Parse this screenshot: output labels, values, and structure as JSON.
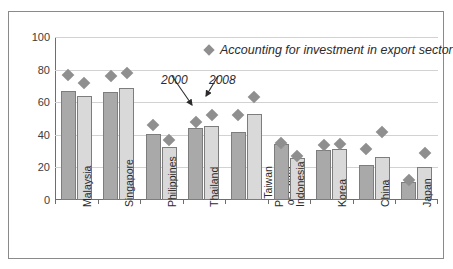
{
  "chart_data": {
    "type": "bar",
    "title": "",
    "subtitle": "",
    "xlabel": "",
    "ylabel": "",
    "ylim": [
      0,
      100
    ],
    "yticks": [
      0,
      20,
      40,
      60,
      80,
      100
    ],
    "grid": true,
    "legend_position": "top-right",
    "categories": [
      "Malaysia",
      "Singapore",
      "Philippines",
      "Thailand",
      "Taiwan Province of China",
      "Indonesia",
      "Korea",
      "China",
      "Japan"
    ],
    "category_label_lines": [
      [
        "Malaysia"
      ],
      [
        "Singapore"
      ],
      [
        "Philippines"
      ],
      [
        "Thailand"
      ],
      [
        "Taiwan",
        "Province",
        "of China"
      ],
      [
        "Indonesia"
      ],
      [
        "Korea"
      ],
      [
        "China"
      ],
      [
        "Japan"
      ]
    ],
    "series": [
      {
        "name": "2000",
        "type": "bar",
        "color": "#a9a9a9",
        "values": [
          67,
          66.5,
          40.5,
          44,
          42,
          34.5,
          30.5,
          21.5,
          11
        ]
      },
      {
        "name": "2008",
        "type": "bar",
        "color": "#d9d9d9",
        "values": [
          64,
          68.5,
          32.5,
          45.5,
          53,
          25.5,
          31.5,
          26.5,
          20
        ]
      },
      {
        "name": "Accounting for investment in export sector (2000)",
        "type": "scatter",
        "color": "#8f8f8f",
        "values": [
          77,
          76,
          46,
          48,
          52,
          35,
          34,
          31,
          12
        ]
      },
      {
        "name": "Accounting for investment in export sector (2008)",
        "type": "scatter",
        "color": "#8f8f8f",
        "values": [
          72,
          78,
          37,
          52,
          63,
          27,
          34.5,
          42,
          29
        ]
      }
    ],
    "legend": [
      {
        "label": "Accounting for investment in export sector",
        "marker": "diamond",
        "color": "#8f8f8f"
      }
    ],
    "annotations": [
      {
        "label": "2000",
        "points_to": "Thailand 2000 bar top"
      },
      {
        "label": "2008",
        "points_to": "Thailand 2008 bar top"
      }
    ]
  },
  "axis": {
    "yticks": [
      "0",
      "20",
      "40",
      "60",
      "80",
      "100"
    ]
  },
  "legend": {
    "text": "Accounting for investment in export sector"
  },
  "callouts": {
    "first": "2000",
    "second": "2008"
  }
}
